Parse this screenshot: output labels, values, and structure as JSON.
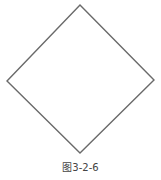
{
  "figure": {
    "shape": "diamond",
    "stroke_color": "#6a6a6a",
    "stroke_width": 1.4,
    "vertices": {
      "top": [
        80,
        5
      ],
      "right": [
        154,
        80
      ],
      "bottom": [
        80,
        153
      ],
      "left": [
        7,
        81
      ]
    }
  },
  "caption": {
    "text": "图3-2-6"
  }
}
